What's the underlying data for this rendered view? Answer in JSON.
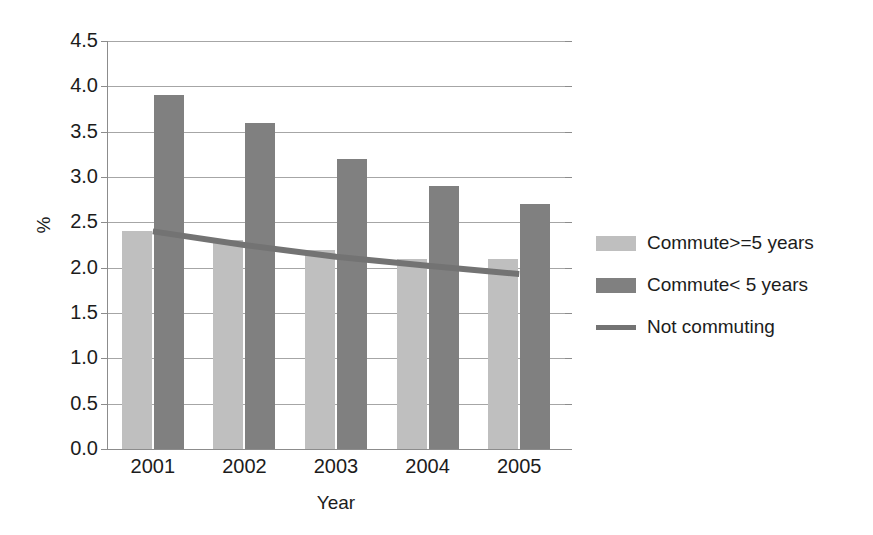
{
  "chart_data": {
    "type": "bar",
    "title": "",
    "subtitle": "",
    "xlabel": "Year",
    "ylabel": "%",
    "categories": [
      "2001",
      "2002",
      "2003",
      "2004",
      "2005"
    ],
    "ylim": [
      0.0,
      4.5
    ],
    "y_ticks": [
      "0.0",
      "0.5",
      "1.0",
      "1.5",
      "2.0",
      "2.5",
      "3.0",
      "3.5",
      "4.0",
      "4.5"
    ],
    "y_tick_values": [
      0.0,
      0.5,
      1.0,
      1.5,
      2.0,
      2.5,
      3.0,
      3.5,
      4.0,
      4.5
    ],
    "grid": true,
    "legend_position": "right",
    "series": [
      {
        "name": "Commute>=5 years",
        "type": "bar",
        "color": "#bfbfbf",
        "values": [
          2.4,
          2.3,
          2.2,
          2.1,
          2.1
        ]
      },
      {
        "name": "Commute< 5 years",
        "type": "bar",
        "color": "#808080",
        "values": [
          3.9,
          3.6,
          3.2,
          2.9,
          2.7
        ]
      },
      {
        "name": "Not commuting",
        "type": "line",
        "color": "#737373",
        "values": [
          2.4,
          2.25,
          2.12,
          2.02,
          1.93
        ]
      }
    ]
  },
  "axes": {
    "y_title": "%",
    "x_title": "Year"
  },
  "legend": {
    "items": [
      {
        "label": "Commute>=5 years",
        "marker": "square-swatch",
        "color": "#bfbfbf"
      },
      {
        "label": "Commute< 5 years",
        "marker": "square-swatch",
        "color": "#808080"
      },
      {
        "label": "Not commuting",
        "marker": "line-swatch",
        "color": "#737373"
      }
    ]
  }
}
